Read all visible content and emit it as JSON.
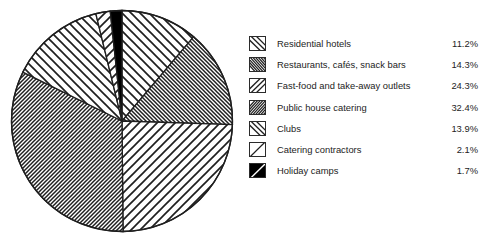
{
  "chart_data": {
    "type": "pie",
    "title": "",
    "subtitle": "",
    "xlabel": "",
    "ylabel": "",
    "legend_position": "right",
    "grid": false,
    "start_angle_clock": "12 o'clock",
    "direction": "clockwise",
    "unit": "%",
    "categories": [
      "Residential hotels",
      "Restaurants, cafés, snack bars",
      "Fast-food and take-away outlets",
      "Public house catering",
      "Clubs",
      "Catering contractors",
      "Holiday camps"
    ],
    "values": [
      11.2,
      14.3,
      24.3,
      32.4,
      13.9,
      2.1,
      1.7
    ],
    "value_labels": [
      "11.2%",
      "14.3%",
      "24.3%",
      "32.4%",
      "13.9%",
      "2.1%",
      "1.7%"
    ],
    "slices": [
      {
        "label": "Residential hotels",
        "value": 11.2,
        "value_label": "11.2%",
        "pattern": "diagonal-backslash-sparse",
        "fill": "#ffffff",
        "stroke": "#1f1f1f"
      },
      {
        "label": "Restaurants, cafés, snack bars",
        "value": 14.3,
        "value_label": "14.3%",
        "pattern": "diagonal-backslash-dense",
        "fill": "#ffffff",
        "stroke": "#1f1f1f"
      },
      {
        "label": "Fast-food and take-away outlets",
        "value": 24.3,
        "value_label": "24.3%",
        "pattern": "diagonal-slash-sparse",
        "fill": "#ffffff",
        "stroke": "#1f1f1f"
      },
      {
        "label": "Public house catering",
        "value": 32.4,
        "value_label": "32.4%",
        "pattern": "diagonal-slash-dense",
        "fill": "#ffffff",
        "stroke": "#1f1f1f"
      },
      {
        "label": "Clubs",
        "value": 13.9,
        "value_label": "13.9%",
        "pattern": "diagonal-backslash-sparse",
        "fill": "#ffffff",
        "stroke": "#1f1f1f"
      },
      {
        "label": "Catering contractors",
        "value": 2.1,
        "value_label": "2.1%",
        "pattern": "diagonal-slash-sparse",
        "fill": "#ffffff",
        "stroke": "#1f1f1f"
      },
      {
        "label": "Holiday camps",
        "value": 1.7,
        "value_label": "1.7%",
        "pattern": "solid-black",
        "fill": "#000000",
        "stroke": "#1f1f1f"
      }
    ]
  },
  "legend": {
    "rows": [
      {
        "label": "Residential hotels",
        "value": "11.2%",
        "swatch": "hatch-backslash-sparse-icon"
      },
      {
        "label": "Restaurants, cafés, snack bars",
        "value": "14.3%",
        "swatch": "hatch-backslash-dense-icon"
      },
      {
        "label": "Fast-food and take-away outlets",
        "value": "24.3%",
        "swatch": "hatch-slash-sparse-icon"
      },
      {
        "label": "Public house catering",
        "value": "32.4%",
        "swatch": "hatch-slash-dense-icon"
      },
      {
        "label": "Clubs",
        "value": "13.9%",
        "swatch": "hatch-backslash-sparse-icon"
      },
      {
        "label": "Catering contractors",
        "value": "2.1%",
        "swatch": "hatch-slash-verysparse-icon"
      },
      {
        "label": "Holiday camps",
        "value": "1.7%",
        "swatch": "solid-black-icon"
      }
    ]
  },
  "colors": {
    "ink": "#1f1f1f",
    "text": "#232323",
    "background": "#ffffff"
  }
}
